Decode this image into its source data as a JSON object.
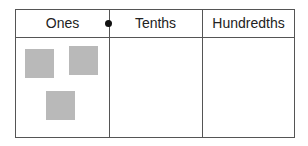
{
  "table": {
    "headers": [
      "Ones",
      "Tenths",
      "Hundredths"
    ],
    "decimal_point": "dot between Ones and Tenths",
    "cells": {
      "ones": {
        "blocks": 3
      },
      "tenths": {
        "blocks": 0
      },
      "hundredths": {
        "blocks": 0
      }
    }
  },
  "colors": {
    "border": "#555555",
    "block": "#b9b9b9",
    "dot": "#111111"
  }
}
